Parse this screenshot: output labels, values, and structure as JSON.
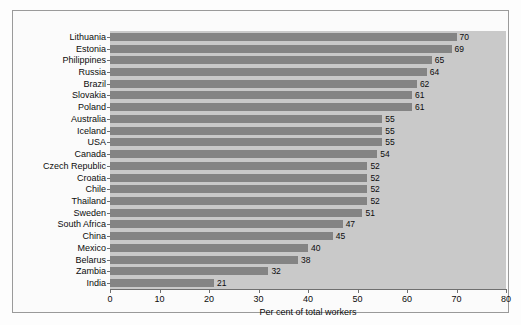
{
  "chart_data": {
    "type": "bar",
    "orientation": "horizontal",
    "title": "",
    "xlabel": "Per cent of total workers",
    "ylabel": "",
    "xlim": [
      0,
      80
    ],
    "ylim": null,
    "xticks": [
      0,
      10,
      20,
      30,
      40,
      50,
      60,
      70,
      80
    ],
    "grid": false,
    "legend": null,
    "bar_color": "#848484",
    "plot_background": "#c9c9c9",
    "categories": [
      "Lithuania",
      "Estonia",
      "Philippines",
      "Russia",
      "Brazil",
      "Slovakia",
      "Poland",
      "Australia",
      "Iceland",
      "USA",
      "Canada",
      "Czech Republic",
      "Croatia",
      "Chile",
      "Thailand",
      "Sweden",
      "South Africa",
      "China",
      "Mexico",
      "Belarus",
      "Zambia",
      "India"
    ],
    "values": [
      70,
      69,
      65,
      64,
      62,
      61,
      61,
      55,
      55,
      55,
      54,
      52,
      52,
      52,
      52,
      51,
      47,
      45,
      40,
      38,
      32,
      21
    ],
    "value_labels": [
      "70",
      "69",
      "65",
      "64",
      "62",
      "61",
      "61",
      "55",
      "55",
      "55",
      "54",
      "52",
      "52",
      "52",
      "52",
      "51",
      "47",
      "45",
      "40",
      "38",
      "32",
      "21"
    ],
    "xtick_labels": [
      "0",
      "10",
      "20",
      "30",
      "40",
      "50",
      "60",
      "70",
      "80"
    ]
  }
}
